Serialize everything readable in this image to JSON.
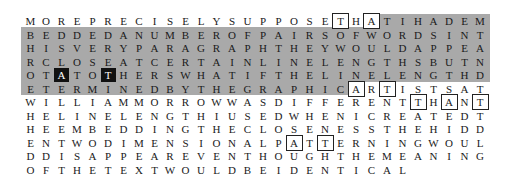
{
  "grid": {
    "columns": 30,
    "origin_x": 23,
    "origin_y": 14,
    "col_step": 15.5,
    "row_step": 13.5,
    "colors": {
      "text": "#1a1a1a",
      "gray_band": "#a9a9a9",
      "box_border": "#222222",
      "inverse_bg": "#111111",
      "inverse_text": "#ffffff"
    },
    "rows": [
      "MOREPRECISELYSUPPOSETHATIHADEM",
      "BEDDEDANUMBEROFPAIRSOFWORDSINT",
      "HISVERYPARAGRAPHTHEYWOULDAPPEA",
      "RCLOSEATCERTAINLINELENGTHSBUTN",
      "OTATOTHERSWHATIFTHELINELENGTHD",
      "ETERMINEDBYTHEGRAPHICARTISTSAT",
      "WILLIAMMORROWWASDIFFERENTTHANT",
      "HELINELENGTHIUSEDWHENICREATEDT",
      "HEEMBEDDINGTHECLOSENESSTHEHIDD",
      "ENTWODIMENSIONALPATTERNINGWOUL",
      "DDISAPPEAREVENTHOUGHTHEMEANING",
      "OFTHETEXTWOULDBEIDENTICAL"
    ],
    "gray_region": [
      {
        "row": 0,
        "from_col": 23,
        "to_col": 29
      },
      {
        "row": 1,
        "from_col": 0,
        "to_col": 29
      },
      {
        "row": 2,
        "from_col": 0,
        "to_col": 29
      },
      {
        "row": 3,
        "from_col": 0,
        "to_col": 29
      },
      {
        "row": 4,
        "from_col": 0,
        "to_col": 29
      },
      {
        "row": 5,
        "from_col": 0,
        "to_col": 20
      }
    ],
    "boxed_cells": [
      {
        "row": 0,
        "col": 20,
        "letter": "T"
      },
      {
        "row": 0,
        "col": 22,
        "letter": "A"
      },
      {
        "row": 5,
        "col": 21,
        "letter": "A"
      },
      {
        "row": 5,
        "col": 23,
        "letter": "T"
      },
      {
        "row": 6,
        "col": 25,
        "letter": "T"
      },
      {
        "row": 6,
        "col": 27,
        "letter": "A"
      },
      {
        "row": 6,
        "col": 29,
        "letter": "T"
      },
      {
        "row": 9,
        "col": 17,
        "letter": "A"
      },
      {
        "row": 9,
        "col": 19,
        "letter": "T"
      }
    ],
    "inverse_cells": [
      {
        "row": 4,
        "col": 2,
        "letter": "A"
      },
      {
        "row": 4,
        "col": 5,
        "letter": "T"
      }
    ]
  }
}
